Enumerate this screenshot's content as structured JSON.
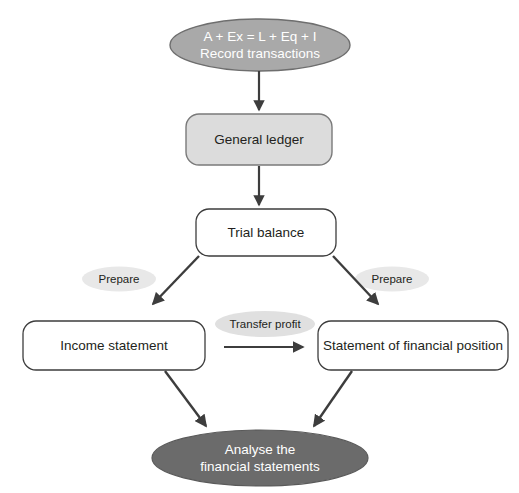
{
  "diagram": {
    "background": "#ffffff",
    "nodes": {
      "record_transactions": {
        "line1": "A + Ex = L + Eq + I",
        "line2": "Record transactions",
        "text": "A + Ex = L + Eq + I\nRecord transactions",
        "shape": "ellipse",
        "fill": "#a9a9a9",
        "stroke": "#6e6e6e",
        "text_color": "#ffffff"
      },
      "general_ledger": {
        "text": "General ledger",
        "shape": "rounded-rect",
        "fill": "#dcdcdc",
        "stroke": "#7a7a7a",
        "text_color": "#231f20"
      },
      "trial_balance": {
        "text": "Trial balance",
        "shape": "rounded-rect",
        "fill": "#ffffff",
        "stroke": "#3d3d3d",
        "text_color": "#231f20"
      },
      "income_statement": {
        "text": "Income statement",
        "shape": "rounded-rect",
        "fill": "#ffffff",
        "stroke": "#3d3d3d",
        "text_color": "#231f20"
      },
      "statement_of_financial_position": {
        "text": "Statement of financial position",
        "shape": "rounded-rect",
        "fill": "#ffffff",
        "stroke": "#3d3d3d",
        "text_color": "#231f20"
      },
      "analyse": {
        "line1": "Analyse the",
        "line2": "financial statements",
        "text": "Analyse the\nfinancial statements",
        "shape": "ellipse",
        "fill": "#6b6b6b",
        "stroke": "#5a5a5a",
        "text_color": "#ffffff"
      }
    },
    "edge_labels": {
      "prepare_left": {
        "text": "Prepare",
        "shape": "ellipse",
        "fill": "#e8e8e8",
        "text_color": "#231f20"
      },
      "prepare_right": {
        "text": "Prepare",
        "shape": "ellipse",
        "fill": "#e8e8e8",
        "text_color": "#231f20"
      },
      "transfer_profit": {
        "text": "Transfer profit",
        "shape": "ellipse",
        "fill": "#e0e0e0",
        "text_color": "#231f20"
      }
    },
    "edges": [
      {
        "from": "record_transactions",
        "to": "general_ledger",
        "style": "arrow-down"
      },
      {
        "from": "general_ledger",
        "to": "trial_balance",
        "style": "arrow-down"
      },
      {
        "from": "trial_balance",
        "to": "income_statement",
        "style": "arrow-diagonal-left",
        "label": "Prepare"
      },
      {
        "from": "trial_balance",
        "to": "statement_of_financial_position",
        "style": "arrow-diagonal-right",
        "label": "Prepare"
      },
      {
        "from": "income_statement",
        "to": "statement_of_financial_position",
        "style": "arrow-right",
        "label": "Transfer profit"
      },
      {
        "from": "income_statement",
        "to": "analyse",
        "style": "arrow-diagonal-right"
      },
      {
        "from": "statement_of_financial_position",
        "to": "analyse",
        "style": "arrow-diagonal-left"
      }
    ],
    "arrow_color": "#3d3d3d"
  }
}
